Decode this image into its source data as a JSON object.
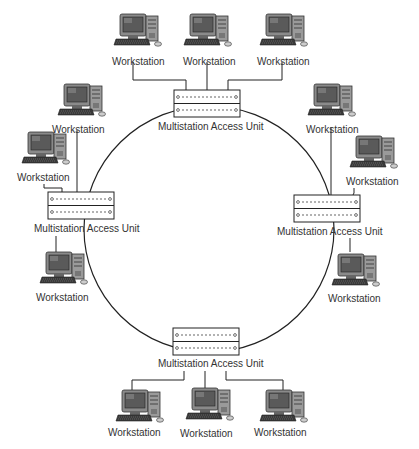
{
  "diagram": {
    "type": "token-ring-network",
    "colors": {
      "line": "#222222",
      "text": "#333333",
      "device": "#777777",
      "screen": "#555555"
    },
    "maus": [
      {
        "id": "top",
        "label": "Multistation Access Unit"
      },
      {
        "id": "left",
        "label": "Multistation Access Unit"
      },
      {
        "id": "right",
        "label": "Multistation Access Unit"
      },
      {
        "id": "bottom",
        "label": "Multistation Access Unit"
      }
    ],
    "workstations": [
      {
        "id": "top-1",
        "label": "Workstation"
      },
      {
        "id": "top-2",
        "label": "Workstation"
      },
      {
        "id": "top-3",
        "label": "Workstation"
      },
      {
        "id": "left-1",
        "label": "Workstation"
      },
      {
        "id": "left-2",
        "label": "Workstation"
      },
      {
        "id": "left-3",
        "label": "Workstation"
      },
      {
        "id": "right-1",
        "label": "Workstation"
      },
      {
        "id": "right-2",
        "label": "Workstation"
      },
      {
        "id": "right-3",
        "label": "Workstation"
      },
      {
        "id": "bottom-1",
        "label": "Workstation"
      },
      {
        "id": "bottom-2",
        "label": "Workstation"
      },
      {
        "id": "bottom-3",
        "label": "Workstation"
      }
    ]
  }
}
